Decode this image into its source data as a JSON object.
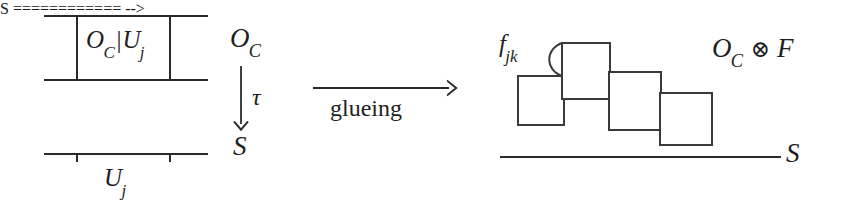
{
  "figure": {
    "type": "commutative-diagram",
    "background_color": "#ffffff",
    "stroke_color": "#2b2b2b"
  },
  "left_panel": {
    "box_label": {
      "main": "O",
      "sub": "C",
      "bar": "|",
      "second_main": "U",
      "second_sub": "j",
      "full": "O_C|U_j"
    },
    "base_label": {
      "main": "U",
      "sub": "j",
      "full": "U_j"
    }
  },
  "projection": {
    "source": {
      "main": "O",
      "sub": "C",
      "full": "O_C"
    },
    "arrow_label": "τ",
    "target": "S"
  },
  "transform_arrow": {
    "label": "glueing",
    "direction": "right"
  },
  "right_panel": {
    "arc_label": {
      "main": "f",
      "sub": "jk",
      "full": "f_jk"
    },
    "tensor_label": {
      "left_main": "O",
      "left_sub": "C",
      "operator": "⊗",
      "right_main": "F",
      "full": "O_C ⊗ F"
    },
    "base_label": "S",
    "squares": [
      {
        "x": 517,
        "y": 75,
        "w": 48,
        "h": 51
      },
      {
        "x": 561,
        "y": 42,
        "w": 50,
        "h": 58
      },
      {
        "x": 608,
        "y": 71,
        "w": 54,
        "h": 60
      },
      {
        "x": 659,
        "y": 92,
        "w": 54,
        "h": 54
      }
    ]
  }
}
